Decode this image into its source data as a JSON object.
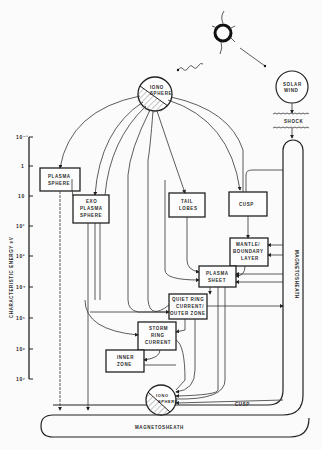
{
  "diagram": {
    "nodes": {
      "ionosphere_top": {
        "label1": "IONO",
        "label2": "SPHERE"
      },
      "solar_wind": {
        "label1": "SOLAR",
        "label2": "WIND"
      },
      "shock": {
        "label": "SHOCK"
      },
      "plasmasphere": {
        "label1": "PLASMA",
        "label2": "SPHERE"
      },
      "exo_plasmasphere": {
        "label1": "EXO",
        "label2": "PLASMA",
        "label3": "SPHERE"
      },
      "tail_lobes": {
        "label1": "TAIL",
        "label2": "LOBES"
      },
      "cusp_box": {
        "label": "CUSP"
      },
      "mantle": {
        "label1": "MANTLE/",
        "label2": "BOUNDARY",
        "label3": "LAYER"
      },
      "plasma_sheet": {
        "label1": "PLASMA",
        "label2": "SHEET"
      },
      "quiet_ring": {
        "label1": "QUIET RING",
        "label2": "CURRENT/",
        "label3": "OUTER ZONE"
      },
      "storm_ring": {
        "label1": "STORM",
        "label2": "RING",
        "label3": "CURRENT"
      },
      "inner_zone": {
        "label1": "INNER",
        "label2": "ZONE"
      },
      "ionosphere_bottom": {
        "label1": "IONO",
        "label2": "SPHERE"
      },
      "cusp_path": {
        "label": "CUSP"
      },
      "magnetosheath_vertical": {
        "label": "MAGNETOSHEATH"
      },
      "magnetosheath_bottom": {
        "label": "MAGNETOSHEATH"
      }
    },
    "axis": {
      "label": "CHARACTERISTIC ENERGY  eV",
      "ticks": [
        "10⁻¹",
        "1",
        "10",
        "10²",
        "10³",
        "10⁴",
        "10⁵",
        "10⁶",
        "10⁷"
      ]
    },
    "colors": {
      "ink": "#222222",
      "paper": "#fbfbfb"
    }
  }
}
